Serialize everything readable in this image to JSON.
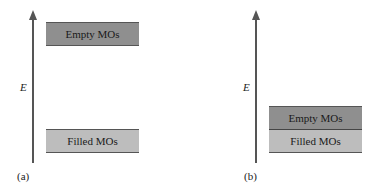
{
  "panels": [
    {
      "label": "(a)",
      "axis_label": "E",
      "bands": [
        {
          "name": "Empty MOs",
          "color": "#8f8f8f"
        },
        {
          "name": "Filled MOs",
          "color": "#bdbdbd"
        }
      ]
    },
    {
      "label": "(b)",
      "axis_label": "E",
      "bands": [
        {
          "name": "Empty MOs",
          "color": "#8f8f8f"
        },
        {
          "name": "Filled MOs",
          "color": "#bdbdbd"
        }
      ]
    }
  ]
}
